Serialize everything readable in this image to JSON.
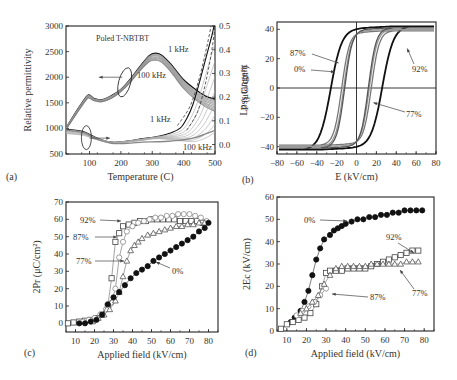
{
  "figure": {
    "panels": [
      "(a)",
      "(b)",
      "(c)",
      "(d)"
    ]
  },
  "chart_data": [
    {
      "id": "a",
      "panel_label": "(a)",
      "type": "line",
      "title": "Poled T-NBTBT",
      "xlabel": "Temperature (C)",
      "ylabel": "Relative permittivity",
      "y2label": "Loss tangent",
      "xlim": [
        25,
        500
      ],
      "ylim": [
        500,
        3000
      ],
      "y2lim": [
        -0.04,
        0.5
      ],
      "xticks": [
        100,
        200,
        300,
        400,
        500
      ],
      "yticks": [
        500,
        1000,
        1500,
        2000,
        2500,
        3000
      ],
      "y2ticks": [
        0.0,
        0.1,
        0.2,
        0.3,
        0.4,
        0.5
      ],
      "annotations": [
        "1 kHz",
        "100 kHz",
        "1 kHz",
        "100 kHz"
      ],
      "series": [
        {
          "name": "permittivity 1 kHz",
          "axis": "left",
          "x": [
            25,
            60,
            90,
            100,
            115,
            140,
            170,
            200,
            230,
            260,
            290,
            310,
            330,
            360,
            400,
            440,
            470,
            500
          ],
          "y": [
            1000,
            1350,
            1620,
            1650,
            1580,
            1560,
            1640,
            1760,
            1960,
            2200,
            2420,
            2470,
            2430,
            2250,
            1950,
            1750,
            1630,
            1570
          ]
        },
        {
          "name": "permittivity 100 kHz",
          "axis": "left",
          "x": [
            25,
            60,
            90,
            100,
            115,
            140,
            170,
            200,
            230,
            260,
            290,
            310,
            330,
            360,
            400,
            440,
            470,
            500
          ],
          "y": [
            980,
            1300,
            1560,
            1590,
            1540,
            1520,
            1590,
            1720,
            1900,
            2120,
            2300,
            2330,
            2290,
            2100,
            1780,
            1550,
            1420,
            1330
          ]
        },
        {
          "name": "loss 1 kHz",
          "axis": "right",
          "x": [
            25,
            80,
            120,
            170,
            220,
            270,
            320,
            360,
            390,
            410,
            430,
            450,
            470,
            490,
            500
          ],
          "y": [
            0.065,
            0.055,
            0.03,
            0.01,
            0.015,
            0.025,
            0.035,
            0.05,
            0.07,
            0.11,
            0.17,
            0.26,
            0.36,
            0.46,
            0.52
          ]
        },
        {
          "name": "loss 100 kHz",
          "axis": "right",
          "x": [
            25,
            80,
            120,
            170,
            220,
            270,
            320,
            360,
            400,
            440,
            470,
            500
          ],
          "y": [
            0.06,
            0.05,
            0.025,
            0.005,
            0.005,
            0.01,
            0.012,
            0.015,
            0.02,
            0.03,
            0.045,
            0.06
          ]
        }
      ]
    },
    {
      "id": "b",
      "panel_label": "(b)",
      "type": "line",
      "xlabel": "E (kV/cm)",
      "ylabel": "P (μC/cm²)",
      "xlim": [
        -80,
        80
      ],
      "ylim": [
        -45,
        45
      ],
      "xticks": [
        -80,
        -60,
        -40,
        -20,
        0,
        20,
        40,
        60,
        80
      ],
      "yticks": [
        -40,
        -20,
        0,
        20,
        40
      ],
      "annotations": [
        "87%",
        "0%",
        "92%",
        "77%"
      ],
      "series": [
        {
          "name": "0%",
          "Ec": 26,
          "Pr": 30,
          "Pmax": 40
        },
        {
          "name": "77%",
          "Ec": 15,
          "Pr": 28,
          "Pmax": 37
        },
        {
          "name": "87%",
          "Ec": 13,
          "Pr": 28,
          "Pmax": 38
        },
        {
          "name": "92%",
          "Ec": 12,
          "Pr": 29,
          "Pmax": 39
        }
      ]
    },
    {
      "id": "c",
      "panel_label": "(c)",
      "type": "scatter",
      "xlabel": "Applied field (kV/cm)",
      "ylabel": "2Pr (μC/cm²)",
      "xlim": [
        5,
        85
      ],
      "ylim": [
        -5,
        70
      ],
      "xticks": [
        10,
        20,
        30,
        40,
        50,
        60,
        70,
        80
      ],
      "yticks": [
        0,
        10,
        20,
        30,
        40,
        50,
        60,
        70
      ],
      "annotations": [
        "92%",
        "87%",
        "77%",
        "0%"
      ],
      "series": [
        {
          "name": "92%",
          "marker": "square-open",
          "x": [
            6,
            9,
            12,
            15,
            18,
            21,
            24,
            27,
            29,
            31,
            33,
            35,
            38,
            41,
            44,
            47,
            50,
            53,
            56,
            59,
            62,
            65,
            68,
            71,
            74,
            77
          ],
          "y": [
            0,
            0.5,
            1,
            1.5,
            2,
            3,
            5,
            10,
            26,
            47,
            52,
            56,
            57,
            58,
            59,
            59,
            60,
            60,
            60,
            60,
            60,
            59,
            59,
            59,
            59,
            58
          ]
        },
        {
          "name": "87%",
          "marker": "circle-open",
          "x": [
            14,
            17,
            20,
            23,
            26,
            29,
            31,
            33,
            35,
            37,
            40,
            43,
            46,
            49,
            52,
            55,
            58,
            61,
            64,
            67,
            70,
            73,
            76,
            79
          ],
          "y": [
            1,
            2,
            3,
            5,
            8,
            12,
            20,
            38,
            47,
            53,
            56,
            58,
            59,
            60,
            61,
            61,
            62,
            62,
            63,
            63,
            63,
            62,
            61,
            59
          ]
        },
        {
          "name": "77%",
          "marker": "triangle-open",
          "x": [
            19,
            22,
            25,
            28,
            31,
            33,
            35,
            37,
            39,
            41,
            43,
            45,
            48,
            51,
            54,
            57,
            60,
            63,
            66,
            69,
            72,
            75,
            78
          ],
          "y": [
            1,
            3,
            5,
            8,
            13,
            18,
            27,
            36,
            42,
            45,
            47,
            49,
            51,
            52,
            53,
            54,
            55,
            56,
            56,
            57,
            57,
            58,
            58
          ]
        },
        {
          "name": "0%",
          "marker": "circle-filled",
          "x": [
            12,
            15,
            18,
            21,
            24,
            27,
            30,
            33,
            36,
            39,
            42,
            45,
            48,
            51,
            54,
            57,
            60,
            63,
            66,
            69,
            72,
            75,
            78,
            80
          ],
          "y": [
            0,
            0,
            1,
            2,
            5,
            11,
            15,
            18,
            22,
            26,
            29,
            31,
            33,
            36,
            38,
            40,
            42,
            44,
            46,
            48,
            50,
            53,
            55,
            58
          ]
        }
      ]
    },
    {
      "id": "d",
      "panel_label": "(d)",
      "type": "scatter",
      "xlabel": "Applied field (kV/cm)",
      "ylabel": "2Ec (kV/cm)",
      "xlim": [
        5,
        85
      ],
      "ylim": [
        0,
        60
      ],
      "xticks": [
        10,
        20,
        30,
        40,
        50,
        60,
        70,
        80
      ],
      "yticks": [
        0,
        10,
        20,
        30,
        40,
        50,
        60
      ],
      "annotations": [
        "0%",
        "92%",
        "87%",
        "77%"
      ],
      "series": [
        {
          "name": "0%",
          "marker": "circle-filled",
          "x": [
            12,
            14,
            17,
            19,
            21,
            23,
            25,
            27,
            29,
            32,
            34,
            36,
            38,
            40,
            43,
            46,
            49,
            52,
            55,
            58,
            61,
            64,
            67,
            70,
            73,
            76,
            79
          ],
          "y": [
            4,
            6,
            9,
            13,
            18,
            25,
            32,
            37,
            41,
            43,
            45,
            46,
            47,
            48,
            49,
            50,
            50,
            51,
            51,
            52,
            52,
            53,
            53,
            54,
            54,
            54,
            54
          ]
        },
        {
          "name": "92%",
          "marker": "square-open",
          "x": [
            7,
            10,
            13,
            16,
            19,
            22,
            25,
            28,
            30,
            32,
            35,
            38,
            41,
            44,
            47,
            50,
            53,
            56,
            59,
            62,
            65,
            68,
            71,
            74,
            77
          ],
          "y": [
            1,
            3,
            4,
            5,
            6,
            8,
            12,
            20,
            26,
            27,
            27,
            27,
            28,
            28,
            28,
            28,
            29,
            30,
            31,
            32,
            33,
            34,
            35,
            36,
            36
          ]
        },
        {
          "name": "87%",
          "marker": "circle-open",
          "x": [
            15,
            18,
            21,
            24,
            27,
            30
          ],
          "y": [
            7,
            9,
            11,
            13,
            16,
            19
          ]
        },
        {
          "name": "77%",
          "marker": "triangle-open",
          "x": [
            17,
            20,
            23,
            26,
            29,
            32,
            35,
            38,
            41,
            44,
            47,
            50,
            53,
            56,
            59,
            62,
            65,
            68,
            71,
            74,
            77
          ],
          "y": [
            8,
            10,
            13,
            16,
            21,
            25,
            28,
            29,
            29,
            29,
            29,
            29,
            30,
            30,
            30,
            30,
            30,
            30,
            31,
            31,
            31
          ]
        }
      ]
    }
  ]
}
